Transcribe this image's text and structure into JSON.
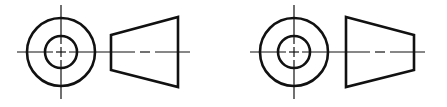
{
  "diagram": {
    "stroke_color": "#111111",
    "background": "#ffffff",
    "views": [
      {
        "id": "option-a",
        "circle_view": {
          "cx": 61,
          "cy": 52,
          "outer_r": 34,
          "inner_r": 16
        },
        "side_view": {
          "shape": "trapezoid",
          "orientation": "wide-right",
          "points": "111,35 178,17 178,87 111,70"
        },
        "centerline": {
          "x1": 17,
          "x2": 190,
          "y": 52
        }
      },
      {
        "id": "option-b",
        "circle_view": {
          "cx": 294,
          "cy": 52,
          "outer_r": 34,
          "inner_r": 16
        },
        "side_view": {
          "shape": "trapezoid",
          "orientation": "wide-left",
          "points": "346,17 414,35 414,70 346,87"
        },
        "centerline": {
          "x1": 250,
          "x2": 425,
          "y": 52
        }
      }
    ]
  }
}
